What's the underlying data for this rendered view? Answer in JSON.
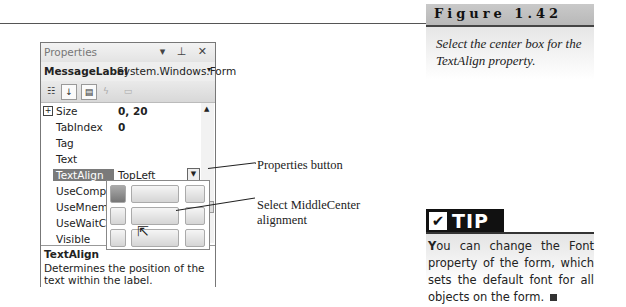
{
  "figure": {
    "title": "Figure 1.42",
    "caption": "Select the center box for the TextAlign property."
  },
  "properties_window": {
    "title": "Properties",
    "title_controls": "▾ ⊥ ✕",
    "object_name": "MessageLabel",
    "object_type": "System.Windows.Form",
    "object_dropdown": "▾",
    "toolbar": [
      "categorized-icon",
      "alphabetical-icon",
      "properties-icon",
      "events-icon",
      "property-pages-icon"
    ],
    "rows": [
      {
        "name": "Size",
        "value": "0, 20",
        "expandable": true,
        "bold": true
      },
      {
        "name": "TabIndex",
        "value": "0",
        "bold": true
      },
      {
        "name": "Tag",
        "value": ""
      },
      {
        "name": "Text",
        "value": ""
      },
      {
        "name": "TextAlign",
        "value": "TopLeft",
        "selected": true
      },
      {
        "name": "UseCompat",
        "value": ""
      },
      {
        "name": "UseMnemo",
        "value": ""
      },
      {
        "name": "UseWaitCur",
        "value": ""
      },
      {
        "name": "Visible",
        "value": ""
      }
    ],
    "description": {
      "title": "TextAlign",
      "body": "Determines the position of the text within the label."
    },
    "alignment_picker": {
      "selected": "TopLeft",
      "hover": "MiddleCenter"
    }
  },
  "callouts": {
    "properties_button": "Properties button",
    "middle_center": "Select MiddleCenter alignment"
  },
  "tip": {
    "badge": "TIP",
    "check": "✔",
    "lead": "Y",
    "text": "ou can change the Font property of the form, which sets the default font for all objects on the form."
  }
}
